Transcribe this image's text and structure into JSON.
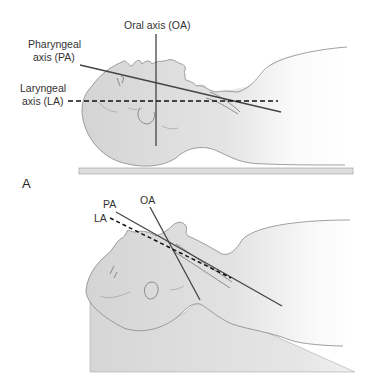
{
  "figure": {
    "panel_a": {
      "panel_label": "A",
      "labels": {
        "oral_axis": "Oral axis (OA)",
        "pharyngeal_axis_line1": "Pharyngeal",
        "pharyngeal_axis_line2": "axis (PA)",
        "laryngeal_axis_line1": "Laryngeal",
        "laryngeal_axis_line2": "axis (LA)"
      }
    },
    "panel_b": {
      "labels": {
        "pharyngeal_axis": "PA",
        "oral_axis": "OA",
        "laryngeal_axis": "LA"
      }
    },
    "colors": {
      "skin_fill": "#d9d9d9",
      "support_fill": "#dcdcdc",
      "outline": "#777777",
      "axis_line": "#444444",
      "dashed_axis": "#111111"
    }
  }
}
